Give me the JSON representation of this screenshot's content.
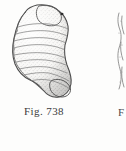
{
  "page": {
    "background_color": "#fdfdfc",
    "width": 126,
    "height": 151
  },
  "figure": {
    "caption": "Fig. 738",
    "ink_color": "#4a4a4a",
    "fill_color": "#f2f1ee",
    "aperture_dot_color": "#2b2b2b"
  },
  "adjacent_figure": {
    "caption_fragment": "F",
    "ink_color": "#6d6d6d",
    "description": "Narrow sliver of the neighbouring illustration cropped at the right page edge."
  }
}
